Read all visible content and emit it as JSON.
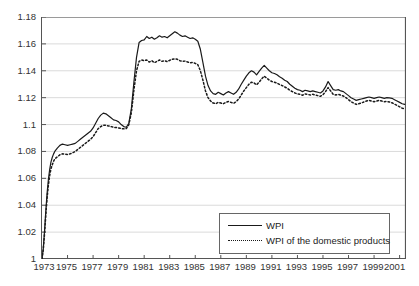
{
  "chart_data": {
    "type": "line",
    "title": "",
    "xlabel": "",
    "ylabel": "",
    "xlim": [
      1973.0,
      2001.5
    ],
    "ylim": [
      1.0,
      1.18
    ],
    "grid": true,
    "legend_position": "bottom-right",
    "xticks": [
      1973,
      1975,
      1977,
      1979,
      1981,
      1983,
      1985,
      1987,
      1989,
      1991,
      1993,
      1995,
      1997,
      1999,
      2001
    ],
    "xtick_labels": [
      "1973",
      "1975",
      "1977",
      "1979",
      "1981",
      "1983",
      "1985",
      "1987",
      "1989",
      "1991",
      "1993",
      "1995",
      "1997",
      "1999",
      "2001"
    ],
    "yticks": [
      1,
      1.02,
      1.04,
      1.06,
      1.08,
      1.1,
      1.12,
      1.14,
      1.16,
      1.18
    ],
    "ytick_labels": [
      "1",
      "1.02",
      "1.04",
      "1.06",
      "1.08",
      "1.1",
      "1.12",
      "1.14",
      "1.16",
      "1.18"
    ],
    "x": [
      1973.0,
      1973.1,
      1973.2,
      1973.3,
      1973.4,
      1973.5,
      1973.6,
      1973.7,
      1973.8,
      1973.9,
      1974.0,
      1974.2,
      1974.4,
      1974.6,
      1974.8,
      1975.0,
      1975.2,
      1975.4,
      1975.6,
      1975.8,
      1976.0,
      1976.2,
      1976.4,
      1976.6,
      1976.8,
      1977.0,
      1977.2,
      1977.4,
      1977.6,
      1977.8,
      1978.0,
      1978.2,
      1978.4,
      1978.6,
      1978.8,
      1979.0,
      1979.2,
      1979.4,
      1979.6,
      1979.8,
      1980.0,
      1980.2,
      1980.4,
      1980.6,
      1980.8,
      1981.0,
      1981.2,
      1981.4,
      1981.6,
      1981.8,
      1982.0,
      1982.2,
      1982.4,
      1982.6,
      1982.8,
      1983.0,
      1983.2,
      1983.4,
      1983.6,
      1983.8,
      1984.0,
      1984.2,
      1984.4,
      1984.6,
      1984.8,
      1985.0,
      1985.2,
      1985.4,
      1985.6,
      1985.8,
      1986.0,
      1986.2,
      1986.4,
      1986.6,
      1986.8,
      1987.0,
      1987.2,
      1987.4,
      1987.6,
      1987.8,
      1988.0,
      1988.2,
      1988.4,
      1988.6,
      1988.8,
      1989.0,
      1989.2,
      1989.4,
      1989.6,
      1989.8,
      1990.0,
      1990.2,
      1990.4,
      1990.6,
      1990.8,
      1991.0,
      1991.2,
      1991.4,
      1991.6,
      1991.8,
      1992.0,
      1992.2,
      1992.4,
      1992.6,
      1992.8,
      1993.0,
      1993.2,
      1993.4,
      1993.6,
      1993.8,
      1994.0,
      1994.2,
      1994.4,
      1994.6,
      1994.8,
      1995.0,
      1995.2,
      1995.4,
      1995.6,
      1995.8,
      1996.0,
      1996.2,
      1996.4,
      1996.6,
      1996.8,
      1997.0,
      1997.2,
      1997.4,
      1997.6,
      1997.8,
      1998.0,
      1998.2,
      1998.4,
      1998.6,
      1998.8,
      1999.0,
      1999.2,
      1999.4,
      1999.6,
      1999.8,
      2000.0,
      2000.2,
      2000.4,
      2000.6,
      2000.8,
      2001.0,
      2001.2,
      2001.4
    ],
    "series": [
      {
        "name": "WPI",
        "style": "solid",
        "color": "#1a1a1a",
        "values": [
          1.0,
          1.008,
          1.021,
          1.036,
          1.049,
          1.059,
          1.0665,
          1.072,
          1.0755,
          1.078,
          1.08,
          1.0825,
          1.0845,
          1.0855,
          1.085,
          1.0845,
          1.085,
          1.0855,
          1.086,
          1.0875,
          1.089,
          1.0905,
          1.092,
          1.0935,
          1.095,
          1.0975,
          1.101,
          1.1045,
          1.107,
          1.1085,
          1.108,
          1.1065,
          1.105,
          1.1035,
          1.103,
          1.102,
          1.1,
          1.0985,
          1.098,
          1.101,
          1.112,
          1.132,
          1.15,
          1.161,
          1.1625,
          1.163,
          1.1655,
          1.164,
          1.165,
          1.1635,
          1.1645,
          1.166,
          1.165,
          1.1655,
          1.1645,
          1.166,
          1.1675,
          1.169,
          1.168,
          1.1665,
          1.1655,
          1.166,
          1.165,
          1.164,
          1.1645,
          1.1635,
          1.162,
          1.156,
          1.146,
          1.136,
          1.129,
          1.125,
          1.123,
          1.1225,
          1.124,
          1.123,
          1.122,
          1.1235,
          1.1245,
          1.1235,
          1.1225,
          1.124,
          1.1265,
          1.13,
          1.133,
          1.136,
          1.1385,
          1.14,
          1.139,
          1.137,
          1.1395,
          1.142,
          1.144,
          1.142,
          1.14,
          1.1385,
          1.138,
          1.137,
          1.1355,
          1.1345,
          1.133,
          1.132,
          1.13,
          1.1285,
          1.127,
          1.126,
          1.1255,
          1.1245,
          1.1255,
          1.125,
          1.1245,
          1.125,
          1.1245,
          1.124,
          1.1235,
          1.125,
          1.128,
          1.132,
          1.129,
          1.126,
          1.1255,
          1.126,
          1.125,
          1.1245,
          1.123,
          1.1215,
          1.12,
          1.119,
          1.118,
          1.1185,
          1.119,
          1.1195,
          1.12,
          1.1205,
          1.12,
          1.1195,
          1.12,
          1.1205,
          1.12,
          1.1195,
          1.12,
          1.1198,
          1.1195,
          1.1185,
          1.1175,
          1.1165,
          1.1155,
          1.115
        ]
      },
      {
        "name": "WPI of the domestic products",
        "style": "dotted",
        "color": "#1a1a1a",
        "values": [
          1.0,
          1.007,
          1.019,
          1.033,
          1.0455,
          1.055,
          1.062,
          1.067,
          1.07,
          1.0725,
          1.0745,
          1.076,
          1.0775,
          1.0782,
          1.078,
          1.0778,
          1.0782,
          1.079,
          1.08,
          1.0815,
          1.083,
          1.0845,
          1.086,
          1.0875,
          1.089,
          1.091,
          1.094,
          1.097,
          1.0985,
          1.0995,
          1.0995,
          1.099,
          1.0985,
          1.098,
          1.0978,
          1.0975,
          1.097,
          1.0968,
          1.097,
          1.1,
          1.109,
          1.126,
          1.14,
          1.147,
          1.148,
          1.1475,
          1.148,
          1.1465,
          1.1475,
          1.146,
          1.147,
          1.148,
          1.147,
          1.1475,
          1.1468,
          1.1478,
          1.1485,
          1.149,
          1.1485,
          1.1475,
          1.147,
          1.1472,
          1.1465,
          1.146,
          1.1462,
          1.1455,
          1.1445,
          1.14,
          1.133,
          1.125,
          1.12,
          1.1175,
          1.116,
          1.1155,
          1.1165,
          1.116,
          1.1155,
          1.1165,
          1.1172,
          1.1165,
          1.1158,
          1.117,
          1.119,
          1.122,
          1.125,
          1.1275,
          1.13,
          1.1315,
          1.131,
          1.1295,
          1.1315,
          1.134,
          1.136,
          1.1345,
          1.133,
          1.132,
          1.1315,
          1.1308,
          1.1298,
          1.129,
          1.128,
          1.127,
          1.1255,
          1.1245,
          1.1235,
          1.1228,
          1.1225,
          1.1218,
          1.1228,
          1.1225,
          1.122,
          1.1225,
          1.122,
          1.1215,
          1.121,
          1.1222,
          1.1245,
          1.1275,
          1.125,
          1.1225,
          1.122,
          1.1225,
          1.1218,
          1.1212,
          1.12,
          1.1185,
          1.117,
          1.116,
          1.115,
          1.1155,
          1.116,
          1.1168,
          1.1175,
          1.118,
          1.1175,
          1.117,
          1.1175,
          1.118,
          1.1175,
          1.117,
          1.1172,
          1.1168,
          1.1162,
          1.1152,
          1.1142,
          1.1132,
          1.1122,
          1.1118
        ]
      }
    ]
  },
  "legend": {
    "items": [
      {
        "label": "WPI",
        "style": "solid"
      },
      {
        "label": "WPI of the domestic products",
        "style": "dotted"
      }
    ]
  }
}
